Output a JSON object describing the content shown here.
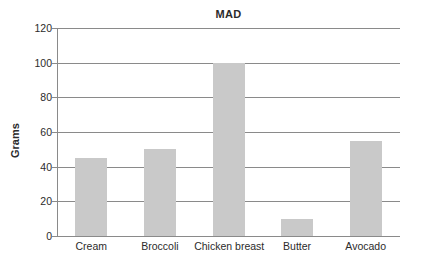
{
  "chart_data": {
    "type": "bar",
    "title": "MAD",
    "xlabel": "",
    "ylabel": "Grams",
    "categories": [
      "Cream",
      "Broccoli",
      "Chicken breast",
      "Butter",
      "Avocado"
    ],
    "values": [
      45,
      50,
      100,
      10,
      55
    ],
    "ylim": [
      0,
      120
    ],
    "yticks": [
      0,
      20,
      40,
      60,
      80,
      100,
      120
    ],
    "ytick_labels": [
      "0",
      "20",
      "40",
      "60",
      "80",
      "100",
      "120"
    ],
    "grid": true,
    "grid_axis": "y",
    "legend": false,
    "legend_position": "none",
    "bar_color": "#c9c9c9",
    "axis_color": "#8a8a8a",
    "text_color": "#2b2b2b",
    "background": "#ffffff"
  }
}
